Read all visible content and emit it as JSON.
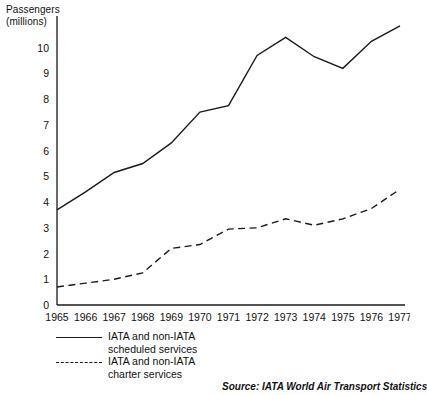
{
  "axis_title": "Passengers\n(millions)",
  "legend": [
    {
      "style": "solid",
      "label": "IATA and non-IATA\nscheduled services"
    },
    {
      "style": "dashed",
      "label": "IATA and non-IATA\ncharter services"
    }
  ],
  "source": "Source: IATA World Air Transport Statistics",
  "colors": {
    "ink": "#1a1a1a",
    "background": "#ffffff"
  },
  "chart_data": {
    "type": "line",
    "title": "",
    "xlabel": "",
    "ylabel": "Passengers (millions)",
    "categories": [
      "1965",
      "1966",
      "1967",
      "1968",
      "1969",
      "1970",
      "1971",
      "1972",
      "1973",
      "1974",
      "1975",
      "1976",
      "1977"
    ],
    "x": [
      1965,
      1966,
      1967,
      1968,
      1969,
      1970,
      1971,
      1972,
      1973,
      1974,
      1975,
      1976,
      1977
    ],
    "ylim": [
      0,
      11
    ],
    "xlim": [
      1965,
      1977
    ],
    "yticks": [
      0,
      1,
      2,
      3,
      4,
      5,
      6,
      7,
      8,
      9,
      10
    ],
    "grid": false,
    "legend_position": "below-axes-left",
    "series": [
      {
        "name": "IATA and non-IATA scheduled services",
        "style": "solid",
        "values": [
          3.7,
          4.4,
          5.15,
          5.5,
          6.3,
          7.5,
          7.75,
          9.7,
          10.4,
          9.65,
          9.2,
          10.25,
          10.85
        ]
      },
      {
        "name": "IATA and non-IATA charter services",
        "style": "dashed",
        "values": [
          0.7,
          0.85,
          1.0,
          1.25,
          2.2,
          2.35,
          2.95,
          3.0,
          3.35,
          3.1,
          3.35,
          3.75,
          4.5
        ]
      }
    ]
  }
}
